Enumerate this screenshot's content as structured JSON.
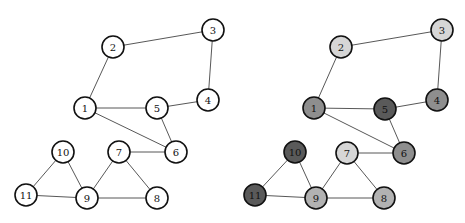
{
  "radius": 11,
  "edges": [
    [
      2,
      3
    ],
    [
      2,
      1
    ],
    [
      3,
      4
    ],
    [
      4,
      5
    ],
    [
      1,
      5
    ],
    [
      1,
      6
    ],
    [
      5,
      6
    ],
    [
      7,
      6
    ],
    [
      10,
      11
    ],
    [
      10,
      9
    ],
    [
      11,
      9
    ],
    [
      7,
      9
    ],
    [
      7,
      8
    ],
    [
      9,
      8
    ]
  ],
  "panels": [
    {
      "name": "left-graph",
      "nodes": [
        {
          "id": 1,
          "label": "1",
          "x": 85,
          "y": 108,
          "fill": "#ffffff"
        },
        {
          "id": 2,
          "label": "2",
          "x": 113,
          "y": 47,
          "fill": "#ffffff"
        },
        {
          "id": 3,
          "label": "3",
          "x": 213,
          "y": 30,
          "fill": "#ffffff"
        },
        {
          "id": 4,
          "label": "4",
          "x": 208,
          "y": 100,
          "fill": "#ffffff"
        },
        {
          "id": 5,
          "label": "5",
          "x": 157,
          "y": 108,
          "fill": "#ffffff"
        },
        {
          "id": 6,
          "label": "6",
          "x": 176,
          "y": 152,
          "fill": "#ffffff"
        },
        {
          "id": 7,
          "label": "7",
          "x": 119,
          "y": 152,
          "fill": "#ffffff"
        },
        {
          "id": 8,
          "label": "8",
          "x": 157,
          "y": 198,
          "fill": "#ffffff"
        },
        {
          "id": 9,
          "label": "9",
          "x": 87,
          "y": 198,
          "fill": "#ffffff"
        },
        {
          "id": 10,
          "label": "10",
          "x": 63,
          "y": 152,
          "fill": "#ffffff"
        },
        {
          "id": 11,
          "label": "11",
          "x": 26,
          "y": 195,
          "fill": "#ffffff"
        }
      ]
    },
    {
      "name": "right-graph",
      "nodes": [
        {
          "id": 1,
          "label": "1",
          "x": 314,
          "y": 108,
          "fill": "#8e8e8e"
        },
        {
          "id": 2,
          "label": "2",
          "x": 341,
          "y": 47,
          "fill": "#d6d6d6"
        },
        {
          "id": 3,
          "label": "3",
          "x": 442,
          "y": 30,
          "fill": "#d6d6d6"
        },
        {
          "id": 4,
          "label": "4",
          "x": 437,
          "y": 100,
          "fill": "#8e8e8e"
        },
        {
          "id": 5,
          "label": "5",
          "x": 385,
          "y": 109,
          "fill": "#5a5a5a"
        },
        {
          "id": 6,
          "label": "6",
          "x": 404,
          "y": 153,
          "fill": "#8e8e8e"
        },
        {
          "id": 7,
          "label": "7",
          "x": 347,
          "y": 153,
          "fill": "#d6d6d6"
        },
        {
          "id": 8,
          "label": "8",
          "x": 384,
          "y": 198,
          "fill": "#b2b2b2"
        },
        {
          "id": 9,
          "label": "9",
          "x": 316,
          "y": 198,
          "fill": "#b2b2b2"
        },
        {
          "id": 10,
          "label": "10",
          "x": 295,
          "y": 152,
          "fill": "#5a5a5a"
        },
        {
          "id": 11,
          "label": "11",
          "x": 255,
          "y": 195,
          "fill": "#5a5a5a"
        }
      ]
    }
  ]
}
